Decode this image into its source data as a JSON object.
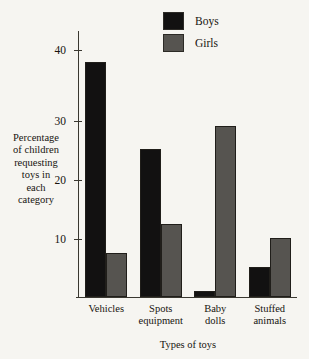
{
  "chart_data": {
    "type": "bar",
    "title": "",
    "categories": [
      "Vehicles",
      "Spots equipment",
      "Baby dolls",
      "Stuffed animals"
    ],
    "series": [
      {
        "name": "Boys",
        "color": "#121111",
        "values": [
          39.8,
          25,
          1,
          5
        ]
      },
      {
        "name": "Girls",
        "color": "#565450",
        "values": [
          7.5,
          12.3,
          29,
          10
        ]
      }
    ],
    "xlabel": "Types of toys",
    "ylabel": "Percentage of children requesting toys in each category",
    "ylim": [
      0,
      45
    ],
    "yticks": [
      10,
      20,
      30,
      40
    ],
    "ytick_labels": [
      "10",
      "20",
      "30",
      "40"
    ],
    "grid": false,
    "legend_position": "top-center"
  },
  "legend": {
    "items": [
      {
        "label": "Boys"
      },
      {
        "label": "Girls"
      }
    ]
  },
  "axes": {
    "y_title_lines": [
      "Percentage",
      "of children",
      "requesting",
      "toys in",
      "each",
      "category"
    ],
    "x_tick_label_lines": [
      [
        "Vehicles"
      ],
      [
        "Spots",
        "equipment"
      ],
      [
        "Baby",
        "dolls"
      ],
      [
        "Stuffed",
        "animals"
      ]
    ],
    "x_title": "Types of toys"
  }
}
